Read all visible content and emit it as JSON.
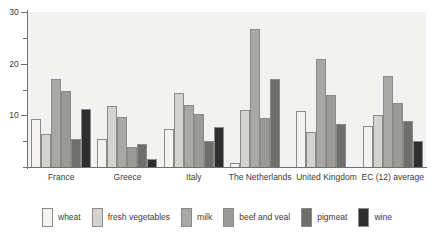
{
  "chart_data": {
    "type": "bar",
    "title": "",
    "xlabel": "",
    "ylabel": "",
    "ylim": [
      0,
      30
    ],
    "yticks": [
      0,
      5,
      10,
      15,
      20,
      25,
      30
    ],
    "ytick_labels": [
      "",
      "",
      "10",
      "",
      "20",
      "",
      "30"
    ],
    "grid": false,
    "legend_position": "bottom",
    "categories": [
      "France",
      "Greece",
      "Italy",
      "The Netherlands",
      "United Kingdom",
      "EC (12) average"
    ],
    "series": [
      {
        "name": "wheat",
        "color": "#f4f3ef",
        "values": [
          9.3,
          5.5,
          7.3,
          0.7,
          10.8,
          8.0
        ]
      },
      {
        "name": "fresh vegetables",
        "color": "#d4d3cd",
        "values": [
          6.3,
          11.8,
          14.3,
          11.0,
          6.8,
          10.0
        ]
      },
      {
        "name": "milk",
        "color": "#a8a8a4",
        "values": [
          17.0,
          9.7,
          12.0,
          26.8,
          21.0,
          17.7
        ]
      },
      {
        "name": "beef and veal",
        "color": "#9a9a96",
        "values": [
          14.8,
          3.8,
          10.3,
          9.5,
          14.0,
          12.3
        ]
      },
      {
        "name": "pigmeat",
        "color": "#6e6e6a",
        "values": [
          5.5,
          4.5,
          5.0,
          17.0,
          8.3,
          9.0
        ]
      },
      {
        "name": "wine",
        "color": "#2e2e2c",
        "values": [
          11.2,
          1.5,
          7.8,
          0,
          0,
          5.0
        ]
      }
    ]
  },
  "legend": {
    "items": [
      {
        "label": "wheat"
      },
      {
        "label": "fresh vegetables"
      },
      {
        "label": "milk"
      },
      {
        "label": "beef and veal"
      },
      {
        "label": "pigmeat"
      },
      {
        "label": "wine"
      }
    ]
  }
}
